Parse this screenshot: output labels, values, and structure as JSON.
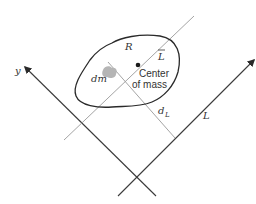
{
  "diagram": {
    "colors": {
      "axis": "#3a3a3a",
      "thin_line": "#9a9a9a",
      "region_outline": "#2a2a2a",
      "mass_element": "#b5b5b5",
      "text": "#333333"
    },
    "labels": {
      "region": "R",
      "mass_element": "dm",
      "center_line_1": "Center",
      "center_line_2": "of mass",
      "parallel_axis": "L",
      "parallel_axis_bar": "L̄",
      "distance": "d",
      "distance_sub": "L",
      "y_axis": "y",
      "l_axis": "L"
    }
  }
}
